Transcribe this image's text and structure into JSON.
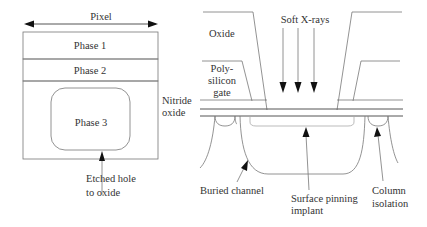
{
  "left_panel": {
    "pixel_label": "Pixel",
    "phase1_label": "Phase 1",
    "phase2_label": "Phase 2",
    "phase3_label": "Phase 3",
    "etched_label_line1": "Etched hole",
    "etched_label_line2": "to oxide"
  },
  "right_panel": {
    "xray_label": "Soft X-rays",
    "oxide_label": "Oxide",
    "poly_label_line1": "Poly-",
    "poly_label_line2": "silicon",
    "poly_label_line3": "gate",
    "nitride_label_line1": "Nitride",
    "nitride_label_line2": "oxide",
    "buried_label": "Buried channel",
    "surface_label_line1": "Surface pinning",
    "surface_label_line2": "implant",
    "column_label_line1": "Column",
    "column_label_line2": "isolation"
  }
}
